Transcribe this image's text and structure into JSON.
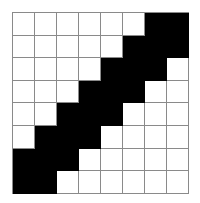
{
  "grid": {
    "rows": 8,
    "cols": 8,
    "filled_color": "#000000",
    "empty_color": "#ffffff",
    "line_color": "#8a8a8a",
    "cells": [
      [
        0,
        0,
        0,
        0,
        0,
        0,
        1,
        1
      ],
      [
        0,
        0,
        0,
        0,
        0,
        1,
        1,
        1
      ],
      [
        0,
        0,
        0,
        0,
        1,
        1,
        1,
        0
      ],
      [
        0,
        0,
        0,
        1,
        1,
        1,
        0,
        0
      ],
      [
        0,
        0,
        1,
        1,
        1,
        0,
        0,
        0
      ],
      [
        0,
        1,
        1,
        1,
        0,
        0,
        0,
        0
      ],
      [
        1,
        1,
        1,
        0,
        0,
        0,
        0,
        0
      ],
      [
        1,
        1,
        0,
        0,
        0,
        0,
        0,
        0
      ]
    ]
  }
}
